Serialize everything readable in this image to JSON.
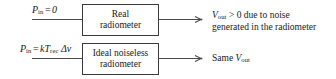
{
  "diagram": {
    "background_color": "#ffffff",
    "line_color": "#4a4a4a",
    "box_border_color": "#3a3a3a",
    "text_color": "#1a1a1a",
    "rows": [
      {
        "id": "real-radiometer-row",
        "input_label": {
          "symbol": "P",
          "symbol_sub": "in",
          "operator": "=",
          "value": "0",
          "plain": "P_in = 0"
        },
        "block": {
          "line1": "Real",
          "line2": "radiometer",
          "plain": "Real radiometer"
        },
        "output_label": {
          "line1_symbol": "V",
          "line1_sub": "out",
          "line1_rest": "> 0 due to noise",
          "line2": "generated in the radiometer",
          "plain": "V_out > 0 due to noise generated in the radiometer"
        }
      },
      {
        "id": "ideal-noiseless-radiometer-row",
        "input_label": {
          "symbol": "P",
          "symbol_sub": "in",
          "operator": "=",
          "value": "kT",
          "value_sub": "rec",
          "value_tail": "Δν",
          "plain": "P_in = kT_rec Δν"
        },
        "block": {
          "line1": "Ideal noiseless",
          "line2": "radiometer",
          "plain": "Ideal noiseless radiometer"
        },
        "output_label": {
          "prefix": "Same",
          "line1_symbol": "V",
          "line1_sub": "out",
          "plain": "Same V_out"
        }
      }
    ]
  }
}
